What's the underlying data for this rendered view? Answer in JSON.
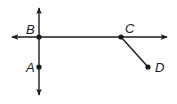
{
  "diagram": {
    "type": "geometry-lines",
    "colors": {
      "stroke": "#1a1a1a",
      "background": "#ffffff"
    },
    "points": [
      {
        "id": "A",
        "label": "A",
        "x": 39,
        "y": 67
      },
      {
        "id": "B",
        "label": "B",
        "x": 39,
        "y": 37
      },
      {
        "id": "C",
        "label": "C",
        "x": 121,
        "y": 37
      },
      {
        "id": "D",
        "label": "D",
        "x": 148,
        "y": 67
      }
    ],
    "lines": [
      {
        "id": "line-AB",
        "kind": "line",
        "through": [
          "A",
          "B"
        ],
        "orientation": "vertical"
      },
      {
        "id": "line-BC",
        "kind": "line",
        "through": [
          "B",
          "C"
        ],
        "orientation": "horizontal"
      }
    ],
    "segments": [
      {
        "id": "segment-CD",
        "kind": "segment",
        "endpoints": [
          "C",
          "D"
        ]
      }
    ]
  }
}
